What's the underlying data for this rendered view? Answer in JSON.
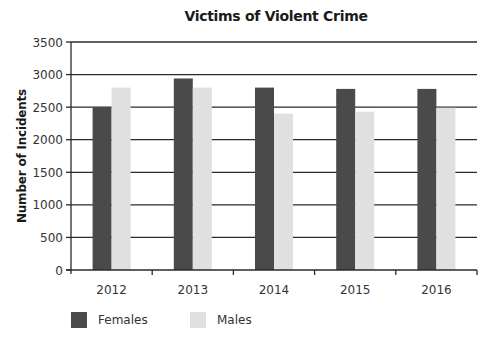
{
  "chart_data": {
    "type": "bar",
    "title": "Victims of Violent Crime",
    "xlabel": "",
    "ylabel": "Number of Incidents",
    "categories": [
      "2012",
      "2013",
      "2014",
      "2015",
      "2016"
    ],
    "series": [
      {
        "name": "Females",
        "color": "#4a4a4a",
        "values": [
          2500,
          2940,
          2800,
          2780,
          2780
        ]
      },
      {
        "name": "Males",
        "color": "#e0e0e0",
        "values": [
          2800,
          2800,
          2400,
          2430,
          2490
        ]
      }
    ],
    "ylim": [
      0,
      3500
    ],
    "yticks": [
      "0",
      "500",
      "1000",
      "1500",
      "2000",
      "2500",
      "3000",
      "3500"
    ],
    "ytick_values": [
      0,
      500,
      1000,
      1500,
      2000,
      2500,
      3000,
      3500
    ],
    "grid": true,
    "legend_position": "bottom-left"
  },
  "title": "Victims of Violent Crime",
  "ylabel": "Number of Incidents",
  "legend": [
    {
      "label": "Females",
      "color": "#4a4a4a"
    },
    {
      "label": "Males",
      "color": "#e0e0e0"
    }
  ]
}
